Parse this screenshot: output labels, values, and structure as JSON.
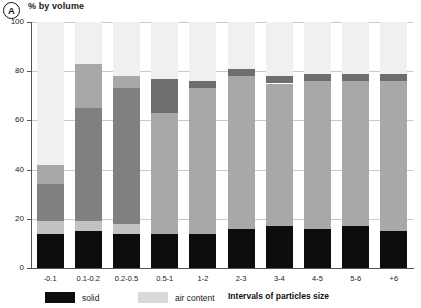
{
  "panel": {
    "label": "A"
  },
  "axis": {
    "y_title": "% by volume",
    "x_title": "Intervals of particles size",
    "y_ticks": [
      "0",
      "20",
      "40",
      "60",
      "80",
      "100"
    ]
  },
  "legend": {
    "items": [
      {
        "name": "solid",
        "color": "#0d0d0d"
      },
      {
        "name": "air content",
        "color": "#d8d8d8"
      }
    ]
  },
  "colors": {
    "solid": "#0d0d0d",
    "light_gray": "#c2c2c2",
    "mid_gray": "#a8a8a8",
    "dark_gray": "#808080",
    "darker_gray": "#6e6e6e",
    "pale_gray": "#d8d8d8",
    "very_pale": "#f0f0f0",
    "axis": "#555555",
    "grid": "#c9c9c9"
  },
  "chart_data": {
    "type": "bar",
    "subtype": "stacked-column",
    "title": "% by volume",
    "xlabel": "Intervals of particles size",
    "ylabel": "% by volume",
    "ylim": [
      0,
      100
    ],
    "grid": true,
    "legend_position": "bottom-left",
    "categories": [
      "-0.1",
      "0.1-0.2",
      "0.2-0.5",
      "0.5-1",
      "1-2",
      "2-3",
      "3-4",
      "4-5",
      "5-6",
      "+6"
    ],
    "series": [
      {
        "name": "solid",
        "color": "#0d0d0d",
        "values": [
          14,
          15,
          14,
          14,
          14,
          16,
          17,
          16,
          17,
          15
        ]
      },
      {
        "name": "band-2",
        "color": "#c2c2c2",
        "values": [
          5,
          4,
          4,
          0,
          0,
          0,
          0,
          0,
          0,
          0
        ]
      },
      {
        "name": "band-3",
        "color": "#808080",
        "values": [
          15,
          46,
          55,
          0,
          0,
          0,
          0,
          0,
          0,
          0
        ]
      },
      {
        "name": "band-4",
        "color": "#a8a8a8",
        "values": [
          8,
          18,
          5,
          49,
          59,
          62,
          58,
          60,
          59,
          61
        ]
      },
      {
        "name": "band-5",
        "color": "#6e6e6e",
        "values": [
          0,
          0,
          0,
          14,
          3,
          3,
          3,
          3,
          3,
          3
        ]
      },
      {
        "name": "air content",
        "color": "#f0f0f0",
        "values": [
          58,
          17,
          22,
          23,
          24,
          19,
          22,
          21,
          21,
          21
        ]
      }
    ],
    "stack_tops": {
      "solid": [
        14,
        15,
        14,
        14,
        14,
        16,
        17,
        16,
        17,
        15
      ],
      "air_start": [
        42,
        83,
        78,
        77,
        76,
        81,
        78,
        79,
        79,
        79
      ]
    }
  }
}
